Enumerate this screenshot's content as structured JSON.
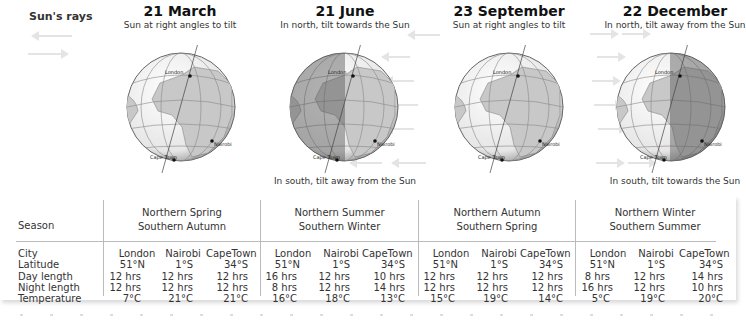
{
  "legend": {
    "title": "Sun's rays",
    "arrows": [
      "left-arrow",
      "right-arrow"
    ]
  },
  "panels": [
    {
      "date": "21 March",
      "north_note": "Sun at right angles to tilt",
      "south_note": "",
      "shade": "none",
      "cities": [
        "London",
        "Nairobi",
        "Cape Town"
      ]
    },
    {
      "date": "21 June",
      "north_note": "In north, tilt towards the Sun",
      "south_note": "In south, tilt away from the Sun",
      "shade": "left",
      "cities": [
        "London",
        "Nairobi",
        "Cape Town"
      ]
    },
    {
      "date": "23 September",
      "north_note": "Sun at right angles to tilt",
      "south_note": "",
      "shade": "none",
      "cities": [
        "London",
        "Nairobi",
        "Cape Town"
      ]
    },
    {
      "date": "22 December",
      "north_note": "In north, tilt away from the Sun",
      "south_note": "In south, tilt towards the Sun",
      "shade": "right",
      "cities": [
        "London",
        "Nairobi",
        "Cape Town"
      ]
    }
  ],
  "table": {
    "row_labels": {
      "season": "Season",
      "city": "City",
      "latitude": "Latitude",
      "day": "Day length",
      "night": "Night length",
      "temp": "Temperature"
    },
    "groups": [
      {
        "season_line1": "Northern Spring",
        "season_line2": "Southern Autumn",
        "cities": [
          "London",
          "Nairobi",
          "CapeTown"
        ],
        "latitude": [
          "51°N",
          "1°S",
          "34°S"
        ],
        "day": [
          "12 hrs",
          "12 hrs",
          "12 hrs"
        ],
        "night": [
          "12 hrs",
          "12 hrs",
          "12 hrs"
        ],
        "temp": [
          "7°C",
          "21°C",
          "21°C"
        ]
      },
      {
        "season_line1": "Northern Summer",
        "season_line2": "Southern Winter",
        "cities": [
          "London",
          "Nairobi",
          "CapeTown"
        ],
        "latitude": [
          "51°N",
          "1°S",
          "34°S"
        ],
        "day": [
          "16 hrs",
          "12 hrs",
          "10 hrs"
        ],
        "night": [
          "8 hrs",
          "12 hrs",
          "14 hrs"
        ],
        "temp": [
          "16°C",
          "18°C",
          "13°C"
        ]
      },
      {
        "season_line1": "Northern Autumn",
        "season_line2": "Southern Spring",
        "cities": [
          "London",
          "Nairobi",
          "CapeTown"
        ],
        "latitude": [
          "51°N",
          "1°S",
          "34°S"
        ],
        "day": [
          "12 hrs",
          "12 hrs",
          "12 hrs"
        ],
        "night": [
          "12 hrs",
          "12 hrs",
          "12 hrs"
        ],
        "temp": [
          "15°C",
          "19°C",
          "14°C"
        ]
      },
      {
        "season_line1": "Northern Winter",
        "season_line2": "Southern Summer",
        "cities": [
          "London",
          "Nairobi",
          "CapeTown"
        ],
        "latitude": [
          "51°N",
          "1°S",
          "34°S"
        ],
        "day": [
          "8 hrs",
          "12 hrs",
          "14 hrs"
        ],
        "night": [
          "16 hrs",
          "12 hrs",
          "10 hrs"
        ],
        "temp": [
          "5°C",
          "19°C",
          "20°C"
        ]
      }
    ]
  }
}
